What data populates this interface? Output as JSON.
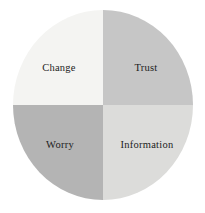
{
  "chart_data": {
    "type": "pie",
    "title": "",
    "subtitle": "",
    "xlabel": "",
    "ylabel": "",
    "legend_position": "none",
    "grid": false,
    "categories": [
      "Change",
      "Trust",
      "Worry",
      "Information"
    ],
    "values": [
      25,
      25,
      25,
      25
    ],
    "value_unit": "percent",
    "slice_colors": [
      "#f4f4f2",
      "#c6c6c6",
      "#b4b4b4",
      "#dcdcda"
    ],
    "annotations": [],
    "series": [
      {
        "name": "Quadrants",
        "values": [
          25,
          25,
          25,
          25
        ]
      }
    ]
  },
  "figure": {
    "background_color": "#ffffff",
    "label_color": "#1c1c1c",
    "circle": {
      "left": 13,
      "top": 10,
      "width": 180,
      "height": 190
    }
  },
  "quadrants": [
    {
      "id": "top-left",
      "label": "Change",
      "color": "#f4f4f2",
      "share": 25
    },
    {
      "id": "top-right",
      "label": "Trust",
      "color": "#c6c6c6",
      "share": 25
    },
    {
      "id": "bottom-left",
      "label": "Worry",
      "color": "#b4b4b4",
      "share": 25
    },
    {
      "id": "bottom-right",
      "label": "Information",
      "color": "#dcdcda",
      "share": 25
    }
  ]
}
